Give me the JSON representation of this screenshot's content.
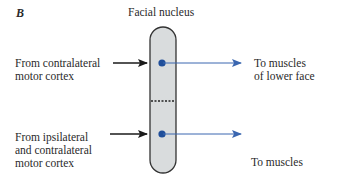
{
  "panel_label": "B",
  "title": "Facial nucleus",
  "inputs": [
    {
      "lines": [
        "From contralateral",
        "motor cortex"
      ]
    },
    {
      "lines": [
        "From ipsilateral",
        "and contralateral",
        "motor cortex"
      ]
    }
  ],
  "outputs": [
    {
      "lines": [
        "To muscles",
        "of lower face"
      ]
    },
    {
      "lines": [
        "To muscles",
        "of upper  face"
      ]
    }
  ],
  "colors": {
    "nucleus_fill": "#d9dcdd",
    "nucleus_stroke": "#333333",
    "dot": "#1f4e9a",
    "output_arrow": "#3a66b0",
    "input_arrow": "#1a1a1a"
  }
}
